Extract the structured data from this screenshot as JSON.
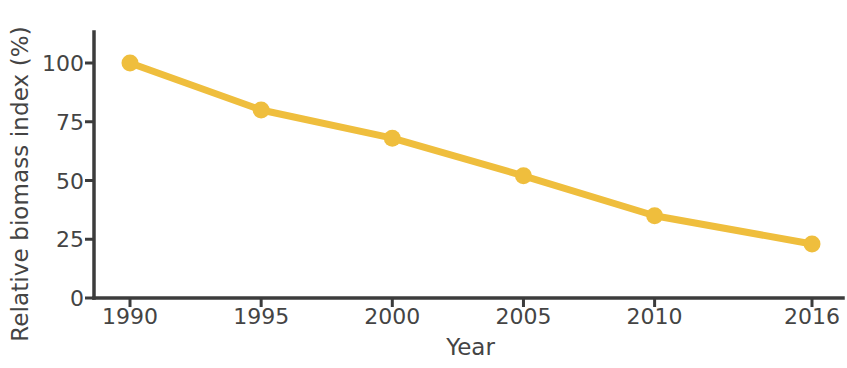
{
  "chart_data": {
    "type": "line",
    "title": "",
    "xlabel": "Year",
    "ylabel": "Relative biomass index (%)",
    "x": [
      1990,
      1995,
      2000,
      2005,
      2010,
      2016
    ],
    "categories": [
      "1990",
      "1995",
      "2000",
      "2005",
      "2010",
      "2016"
    ],
    "values": [
      100,
      80,
      68,
      52,
      35,
      23
    ],
    "series": [
      {
        "name": "Relative biomass index",
        "values": [
          100,
          80,
          68,
          52,
          35,
          23
        ],
        "color": "#EFBE3D",
        "marker": "circle"
      }
    ],
    "xtick_labels": [
      "1990",
      "1995",
      "2000",
      "2005",
      "2010",
      "2016"
    ],
    "ytick_labels": [
      "0",
      "25",
      "50",
      "75",
      "100"
    ],
    "yticks": [
      0,
      25,
      50,
      75,
      100
    ],
    "ylim": [
      0,
      110
    ],
    "xlim": [
      1988.5,
      2017.5
    ],
    "grid": false,
    "legend": false,
    "legend_position": "none",
    "annotations": [],
    "colors": {
      "line": "#EFBE3D",
      "marker": "#EFBE3D",
      "axis": "#3c3c3c",
      "text": "#444444",
      "background": "#ffffff"
    },
    "style": {
      "spines": [
        "left",
        "bottom"
      ],
      "tick_direction": "out",
      "line_width_px": 7,
      "marker_size_px": 17
    }
  }
}
